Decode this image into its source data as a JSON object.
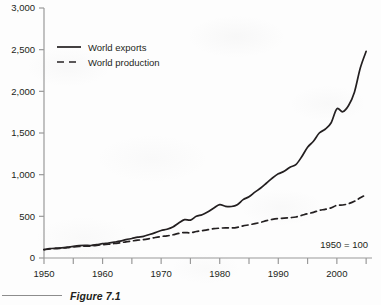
{
  "caption": {
    "label": "Figure 7.1"
  },
  "annotation": {
    "base_note": "1950 = 100"
  },
  "colors": {
    "line": "#231f20",
    "axis": "#9a9a9a",
    "text": "#231f20",
    "background": "#fdfdfd"
  },
  "chart_data": {
    "type": "line",
    "title": "",
    "subtitle": "",
    "xlabel": "",
    "ylabel": "",
    "note": "1950 = 100",
    "grid": false,
    "legend_position": "top-left",
    "xlim": [
      1950,
      2006
    ],
    "ylim": [
      0,
      3000
    ],
    "ytick_labels": [
      "0",
      "500",
      "1,000",
      "1,500",
      "2,000",
      "2,500",
      "3,000"
    ],
    "ytick_values": [
      0,
      500,
      1000,
      1500,
      2000,
      2500,
      3000
    ],
    "xtick_labels": [
      "1950",
      "1960",
      "1970",
      "1980",
      "1990",
      "2000"
    ],
    "xtick_values": [
      1950,
      1960,
      1970,
      1980,
      1990,
      2000
    ],
    "xtick_minor_values": [
      1955,
      1965,
      1975,
      1985,
      1995,
      2005
    ],
    "series": [
      {
        "name": "World exports",
        "style": "solid",
        "x": [
          1950,
          1951,
          1952,
          1953,
          1954,
          1955,
          1956,
          1957,
          1958,
          1959,
          1960,
          1961,
          1962,
          1963,
          1964,
          1965,
          1966,
          1967,
          1968,
          1969,
          1970,
          1971,
          1972,
          1973,
          1974,
          1975,
          1976,
          1977,
          1978,
          1979,
          1980,
          1981,
          1982,
          1983,
          1984,
          1985,
          1986,
          1987,
          1988,
          1989,
          1990,
          1991,
          1992,
          1993,
          1994,
          1995,
          1996,
          1997,
          1998,
          1999,
          2000,
          2001,
          2002,
          2003,
          2004,
          2005
        ],
        "values": [
          100,
          112,
          118,
          122,
          130,
          140,
          148,
          152,
          150,
          160,
          172,
          180,
          190,
          202,
          220,
          234,
          250,
          260,
          282,
          305,
          330,
          345,
          372,
          420,
          460,
          455,
          500,
          520,
          555,
          600,
          640,
          620,
          618,
          640,
          700,
          735,
          790,
          840,
          900,
          960,
          1010,
          1040,
          1090,
          1120,
          1215,
          1330,
          1400,
          1500,
          1545,
          1620,
          1790,
          1755,
          1830,
          1990,
          2280,
          2480
        ]
      },
      {
        "name": "World production",
        "style": "dashed",
        "x": [
          1950,
          1951,
          1952,
          1953,
          1954,
          1955,
          1956,
          1957,
          1958,
          1959,
          1960,
          1961,
          1962,
          1963,
          1964,
          1965,
          1966,
          1967,
          1968,
          1969,
          1970,
          1971,
          1972,
          1973,
          1974,
          1975,
          1976,
          1977,
          1978,
          1979,
          1980,
          1981,
          1982,
          1983,
          1984,
          1985,
          1986,
          1987,
          1988,
          1989,
          1990,
          1991,
          1992,
          1993,
          1994,
          1995,
          1996,
          1997,
          1998,
          1999,
          2000,
          2001,
          2002,
          2003,
          2004,
          2005
        ],
        "values": [
          100,
          108,
          112,
          118,
          124,
          132,
          138,
          142,
          144,
          152,
          160,
          166,
          174,
          182,
          194,
          204,
          214,
          220,
          232,
          246,
          258,
          266,
          278,
          296,
          305,
          302,
          318,
          328,
          340,
          352,
          358,
          362,
          360,
          368,
          385,
          398,
          412,
          428,
          448,
          464,
          474,
          478,
          484,
          492,
          512,
          532,
          548,
          572,
          584,
          602,
          632,
          636,
          652,
          680,
          722,
          760
        ]
      }
    ],
    "legend": [
      {
        "label": "World exports",
        "style": "solid"
      },
      {
        "label": "World production",
        "style": "dashed"
      }
    ]
  }
}
